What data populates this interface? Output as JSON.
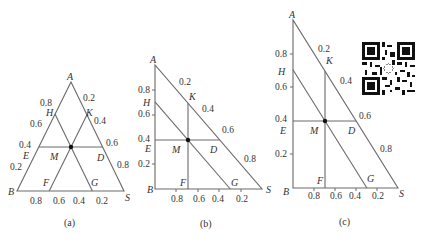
{
  "figure": {
    "panels": [
      {
        "id": "a",
        "caption": "(a)",
        "type": "equilateral-ternary",
        "vertices": {
          "A": "A",
          "B": "B",
          "S": "S"
        },
        "points": {
          "H": "H",
          "K": "K",
          "E": "E",
          "D": "D",
          "M": "M",
          "F": "F",
          "G": "G"
        },
        "left_ticks": [
          "0.8",
          "0.6",
          "0.4",
          "0.2"
        ],
        "right_ticks": [
          "0.2",
          "0.4",
          "0.6",
          "0.8"
        ],
        "bottom_ticks": [
          "0.8",
          "0.6",
          "0.4",
          "0.2"
        ]
      },
      {
        "id": "b",
        "caption": "(b)",
        "type": "right-triangle-ternary",
        "vertices": {
          "A": "A",
          "B": "B",
          "S": "S"
        },
        "points": {
          "H": "H",
          "K": "K",
          "E": "E",
          "D": "D",
          "M": "M",
          "F": "F",
          "G": "G"
        },
        "left_ticks": [
          "0.8",
          "0.6",
          "0.4",
          "0.2"
        ],
        "right_ticks": [
          "0.2",
          "0.4",
          "0.6",
          "0.8"
        ],
        "bottom_ticks": [
          "0.8",
          "0.6",
          "0.4",
          "0.2"
        ]
      },
      {
        "id": "c",
        "caption": "(c)",
        "type": "right-triangle-ternary",
        "vertices": {
          "A": "A",
          "B": "B",
          "S": "S"
        },
        "points": {
          "H": "H",
          "K": "K",
          "E": "E",
          "D": "D",
          "M": "M",
          "F": "F",
          "G": "G"
        },
        "left_ticks": [
          "0.8",
          "0.6",
          "0.4",
          "0.2"
        ],
        "right_ticks": [
          "0.2",
          "0.4",
          "0.6",
          "0.8"
        ],
        "bottom_ticks": [
          "0.8",
          "0.6",
          "0.4",
          "0.2"
        ]
      }
    ],
    "qr_code": "qr-code"
  }
}
